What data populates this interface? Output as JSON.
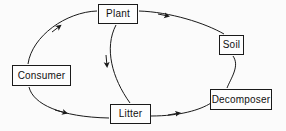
{
  "diagram": {
    "background_color": "#fbfbfb",
    "line_color": "#1a1a1a",
    "box_fill_color": "#fdfdfd",
    "text_color": "#111111",
    "nodes": [
      {
        "id": "plant",
        "label": "Plant",
        "x": 98,
        "y": 4,
        "w": 40,
        "h": 20
      },
      {
        "id": "consumer",
        "label": "Consumer",
        "x": 12,
        "y": 65,
        "w": 59,
        "h": 21
      },
      {
        "id": "soil",
        "label": "Soil",
        "x": 219,
        "y": 35,
        "w": 25,
        "h": 20
      },
      {
        "id": "litter",
        "label": "Litter",
        "x": 110,
        "y": 104,
        "w": 41,
        "h": 20
      },
      {
        "id": "decomposer",
        "label": "Decomposer",
        "x": 210,
        "y": 89,
        "w": 62,
        "h": 21
      }
    ],
    "edges": [
      {
        "id": "consumer-to-plant",
        "from": "Consumer",
        "to": "Plant",
        "arrow": true
      },
      {
        "id": "plant-to-soil",
        "from": "Plant",
        "to": "Soil",
        "arrow": true
      },
      {
        "id": "plant-to-litter",
        "from": "Plant",
        "to": "Litter",
        "arrow": true
      },
      {
        "id": "consumer-to-litter",
        "from": "Consumer",
        "to": "Litter",
        "arrow": true
      },
      {
        "id": "litter-to-decomposer",
        "from": "Litter",
        "to": "Decomposer",
        "arrow": true
      },
      {
        "id": "soil-to-decomposer",
        "from": "Soil",
        "to": "Decomposer",
        "arrow": false
      },
      {
        "id": "decomposer-to-soil",
        "from": "Decomposer",
        "to": "Soil",
        "arrow": false
      }
    ]
  }
}
